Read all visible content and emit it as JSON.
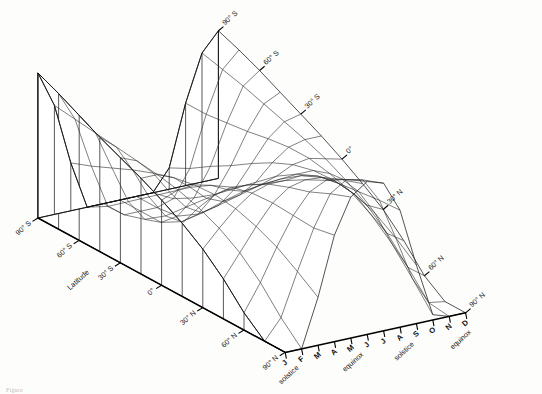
{
  "figure": {
    "caption": "Figure",
    "background_color": "#fdfdfb",
    "line_color": "#1a1a1a"
  },
  "axes": {
    "latitude_axis_title": "Latitude",
    "latitude_ticks_left": [
      "90° S",
      "60° S",
      "30° S",
      "0°",
      "30° N",
      "60° N",
      "90° N"
    ],
    "latitude_ticks_top": [
      "90° S",
      "60° S",
      "30° S",
      "0°",
      "30° N",
      "60° N",
      "90° N"
    ],
    "month_ticks": [
      "J",
      "F",
      "M",
      "A",
      "M",
      "J",
      "J",
      "A",
      "S",
      "O",
      "N",
      "D"
    ],
    "event_solstice_front": "solstice",
    "event_equinox_front": "equinox",
    "event_solstice_right": "solstice",
    "event_equinox_right": "equinox"
  },
  "chart_data": {
    "type": "surface",
    "title": "",
    "xlabel": "Latitude",
    "ylabel": "Month of year",
    "zlabel": "Daily insolation",
    "grid": true,
    "legend": false,
    "x": [
      -90,
      -75,
      -60,
      -45,
      -30,
      -15,
      0,
      15,
      30,
      45,
      60,
      75,
      90
    ],
    "x_tick_labels": [
      "90° S",
      "",
      "60° S",
      "",
      "30° S",
      "",
      "0°",
      "",
      "30° N",
      "",
      "60° N",
      "",
      "90° N"
    ],
    "y": [
      1,
      2,
      3,
      4,
      5,
      6,
      7,
      8,
      9,
      10,
      11,
      12
    ],
    "y_tick_labels": [
      "J",
      "F",
      "M",
      "A",
      "M",
      "J",
      "J",
      "A",
      "S",
      "O",
      "N",
      "D"
    ],
    "annotations": [
      "solstice",
      "equinox",
      "solstice",
      "equinox"
    ],
    "zlim": [
      0,
      1.12
    ],
    "z_note": "Relative daily solar insolation at top of atmosphere; rows are latitudes 90S..90N, columns are months J..D",
    "z": [
      [
        1.09,
        0.82,
        0.36,
        0.0,
        0.0,
        0.0,
        0.0,
        0.0,
        0.16,
        0.62,
        0.97,
        1.11
      ],
      [
        1.02,
        0.8,
        0.42,
        0.09,
        0.0,
        0.0,
        0.0,
        0.04,
        0.24,
        0.62,
        0.93,
        1.05
      ],
      [
        0.94,
        0.78,
        0.49,
        0.21,
        0.05,
        0.0,
        0.02,
        0.13,
        0.34,
        0.64,
        0.89,
        0.98
      ],
      [
        0.86,
        0.76,
        0.56,
        0.33,
        0.16,
        0.09,
        0.12,
        0.24,
        0.43,
        0.66,
        0.84,
        0.9
      ],
      [
        0.79,
        0.74,
        0.62,
        0.45,
        0.31,
        0.24,
        0.27,
        0.37,
        0.53,
        0.69,
        0.79,
        0.82
      ],
      [
        0.72,
        0.72,
        0.67,
        0.57,
        0.46,
        0.41,
        0.43,
        0.5,
        0.62,
        0.71,
        0.74,
        0.74
      ],
      [
        0.64,
        0.69,
        0.7,
        0.67,
        0.61,
        0.57,
        0.59,
        0.63,
        0.69,
        0.71,
        0.68,
        0.65
      ],
      [
        0.55,
        0.64,
        0.71,
        0.74,
        0.73,
        0.71,
        0.72,
        0.73,
        0.73,
        0.68,
        0.6,
        0.55
      ],
      [
        0.44,
        0.57,
        0.69,
        0.78,
        0.82,
        0.82,
        0.83,
        0.8,
        0.74,
        0.63,
        0.5,
        0.44
      ],
      [
        0.3,
        0.47,
        0.64,
        0.79,
        0.88,
        0.91,
        0.9,
        0.83,
        0.72,
        0.54,
        0.37,
        0.29
      ],
      [
        0.13,
        0.33,
        0.57,
        0.78,
        0.93,
        0.99,
        0.97,
        0.85,
        0.66,
        0.41,
        0.2,
        0.11
      ],
      [
        0.0,
        0.15,
        0.47,
        0.77,
        1.0,
        1.08,
        1.05,
        0.87,
        0.56,
        0.23,
        0.02,
        0.0
      ],
      [
        0.0,
        0.0,
        0.36,
        0.8,
        1.06,
        1.15,
        1.11,
        0.88,
        0.44,
        0.04,
        0.0,
        0.0
      ]
    ]
  }
}
